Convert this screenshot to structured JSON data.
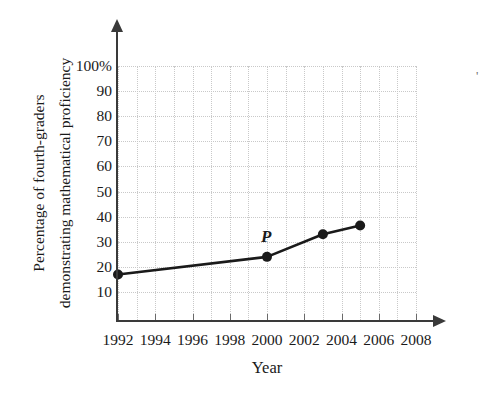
{
  "chart_data": {
    "type": "line",
    "title": "",
    "xlabel": "Year",
    "ylabel": "Percentage of fourth-graders demonstrating mathematical proficiency",
    "ylabel_lines": [
      "Percentage of fourth-graders",
      "demonstrating mathematical proficiency"
    ],
    "x": [
      1992,
      2000,
      2003,
      2005
    ],
    "values": [
      17,
      24,
      33,
      36.5
    ],
    "series": [
      {
        "name": "Percentage of fourth-graders demonstrating mathematical proficiency",
        "x": [
          1992,
          2000,
          2003,
          2005
        ],
        "values": [
          17,
          24,
          33,
          36.5
        ]
      }
    ],
    "point_annotations": [
      {
        "label": "P",
        "x": 2000,
        "y": 24
      }
    ],
    "xlim": [
      1992,
      2008
    ],
    "ylim": [
      0,
      100
    ],
    "xticks": [
      1992,
      1994,
      1996,
      1998,
      2000,
      2002,
      2004,
      2006,
      2008
    ],
    "xtick_labels": [
      "1992",
      "1994",
      "1996",
      "1998",
      "2000",
      "2002",
      "2004",
      "2006",
      "2008"
    ],
    "yticks": [
      10,
      20,
      30,
      40,
      50,
      60,
      70,
      80,
      90,
      100
    ],
    "ytick_labels": [
      "10",
      "20",
      "30",
      "40",
      "50",
      "60",
      "70",
      "80",
      "90",
      "100%"
    ],
    "grid": true,
    "grid_style": "dotted",
    "grid_color": "#c9c9c9",
    "legend": "none",
    "line_color": "#1a1a1a",
    "marker": "circle",
    "marker_color": "#1a1a1a",
    "axis_color": "#3a3a3a",
    "background": "#ffffff"
  }
}
